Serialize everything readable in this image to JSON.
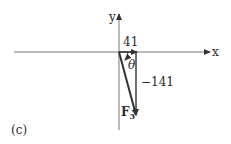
{
  "diagram": {
    "panel_label": "(c)",
    "axes": {
      "x_label": "x",
      "y_label": "y"
    },
    "components": {
      "x_value": "41",
      "y_value": "−141"
    },
    "angle_label": "θ",
    "vector_label": "F",
    "vector_subscript": "3",
    "colors": {
      "line": "#3a3a3a",
      "axis": "#6a6a6a",
      "background": "#ffffff"
    }
  }
}
